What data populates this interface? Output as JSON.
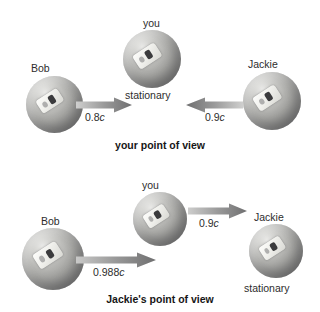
{
  "figure": {
    "type": "physics-diagram"
  },
  "panels": [
    {
      "id": "your-point-of-view",
      "caption": "your point of view",
      "objects": [
        {
          "name": "Bob",
          "label": "Bob",
          "state": ""
        },
        {
          "name": "you",
          "label": "you",
          "state": "stationary"
        },
        {
          "name": "Jackie",
          "label": "Jackie",
          "state": ""
        }
      ],
      "arrows": [
        {
          "from": "Bob",
          "to": "you",
          "direction": "right",
          "speed": "0.8",
          "unit": "c"
        },
        {
          "from": "Jackie",
          "to": "you",
          "direction": "left",
          "speed": "0.9",
          "unit": "c"
        }
      ]
    },
    {
      "id": "jackies-point-of-view",
      "caption": "Jackie's point of view",
      "objects": [
        {
          "name": "Bob",
          "label": "Bob",
          "state": ""
        },
        {
          "name": "you",
          "label": "you",
          "state": ""
        },
        {
          "name": "Jackie",
          "label": "Jackie",
          "state": "stationary"
        }
      ],
      "arrows": [
        {
          "from": "Bob",
          "to": "Jackie",
          "direction": "right",
          "speed": "0.988",
          "unit": "c"
        },
        {
          "from": "you",
          "to": "Jackie",
          "direction": "right",
          "speed": "0.9",
          "unit": "c"
        }
      ]
    }
  ],
  "colors": {
    "background": "#ffffff",
    "sphere_light": "#e9e9e7",
    "sphere_dark": "#6d6d6e",
    "arrow_dark": "#6f6f70",
    "arrow_light": "#d3d3d2",
    "text": "#2d2d2d"
  }
}
